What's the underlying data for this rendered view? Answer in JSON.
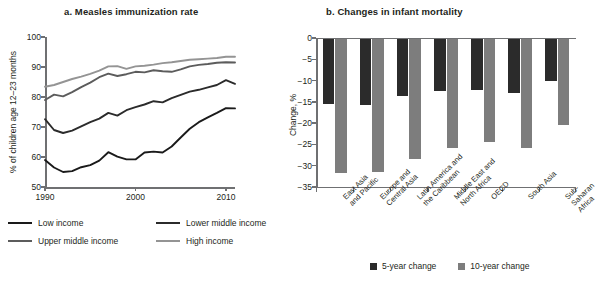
{
  "figure": {
    "panel_a": {
      "title": "a.  Measles immunization rate",
      "ylabel": "% of children age 12–23 months",
      "yticks": [
        "100",
        "90",
        "80",
        "70",
        "60",
        "50"
      ],
      "xticks": [
        "1990",
        "2000",
        "2010"
      ],
      "legend": [
        {
          "label": "Low income",
          "color": "#1a1a1a"
        },
        {
          "label": "Lower middle income",
          "color": "#2b2b2b"
        },
        {
          "label": "Upper middle income",
          "color": "#5c5c5c"
        },
        {
          "label": "High income",
          "color": "#949494"
        }
      ]
    },
    "panel_b": {
      "title": "b.  Changes in infant mortality",
      "ylabel": "Change, %",
      "yticks": [
        "0",
        "−5",
        "−10",
        "−15",
        "−20",
        "−25",
        "−30",
        "−35"
      ],
      "legend": [
        {
          "label": "5-year change",
          "color": "#2b2b2b"
        },
        {
          "label": "10-year change",
          "color": "#7d7d7d"
        }
      ]
    }
  },
  "chart_data": [
    {
      "type": "line",
      "panel": "a",
      "title": "a.  Measles immunization rate",
      "xlabel": "",
      "ylabel": "% of children age 12–23 months",
      "ylim": [
        50,
        100
      ],
      "xlim": [
        1990,
        2011
      ],
      "grid": false,
      "legend_position": "below-plot",
      "x": [
        1990,
        1991,
        1992,
        1993,
        1994,
        1995,
        1996,
        1997,
        1998,
        1999,
        2000,
        2001,
        2002,
        2003,
        2004,
        2005,
        2006,
        2007,
        2008,
        2009,
        2010,
        2011
      ],
      "series": [
        {
          "name": "Low income",
          "color": "#1a1a1a",
          "values": [
            59.0,
            56.5,
            55.0,
            55.3,
            56.6,
            57.3,
            58.8,
            61.6,
            60.1,
            59.2,
            59.2,
            61.5,
            61.8,
            61.5,
            63.5,
            66.5,
            69.4,
            71.6,
            73.2,
            74.7,
            76.3,
            76.2
          ]
        },
        {
          "name": "Lower middle income",
          "color": "#2b2b2b",
          "values": [
            72.6,
            69.0,
            68.0,
            68.8,
            70.2,
            71.6,
            72.8,
            74.7,
            73.8,
            75.6,
            76.6,
            77.5,
            78.6,
            78.2,
            79.6,
            80.7,
            81.8,
            82.4,
            83.2,
            84.0,
            85.6,
            84.4
          ]
        },
        {
          "name": "Upper middle income",
          "color": "#5c5c5c",
          "values": [
            79.0,
            80.8,
            80.2,
            81.6,
            83.3,
            84.8,
            86.6,
            87.8,
            87.0,
            87.6,
            88.4,
            88.2,
            88.9,
            88.6,
            88.4,
            89.2,
            90.2,
            90.7,
            91.0,
            91.4,
            91.6,
            91.5
          ]
        },
        {
          "name": "High income",
          "color": "#949494",
          "values": [
            83.4,
            84.0,
            85.0,
            86.0,
            86.8,
            87.7,
            88.8,
            90.2,
            90.3,
            89.4,
            90.2,
            90.4,
            90.8,
            91.3,
            91.6,
            92.0,
            92.4,
            92.6,
            92.8,
            93.0,
            93.4,
            93.4
          ]
        }
      ]
    },
    {
      "type": "bar",
      "panel": "b",
      "title": "b.  Changes in infant mortality",
      "xlabel": "",
      "ylabel": "Change, %",
      "ylim": [
        -35,
        0
      ],
      "grid": false,
      "legend_position": "below-plot",
      "categories": [
        "East Asia\nand Pacific",
        "Europe and\nCentral Asia",
        "Latin America and\nthe Caribbean",
        "Middle East and\nNorth Africa",
        "OECD",
        "South Asia",
        "Sub-Saharan\nAfrica"
      ],
      "series": [
        {
          "name": "5-year change",
          "color": "#2b2b2b",
          "values": [
            -15.2,
            -15.5,
            -13.5,
            -12.3,
            -12.0,
            -12.7,
            -9.8
          ]
        },
        {
          "name": "10-year change",
          "color": "#7d7d7d",
          "values": [
            -31.5,
            -31.2,
            -28.2,
            -25.7,
            -24.2,
            -25.5,
            -20.2
          ]
        }
      ]
    }
  ]
}
